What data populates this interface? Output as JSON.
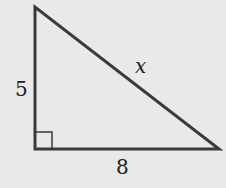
{
  "diagram": {
    "type": "right-triangle",
    "labels": {
      "left_leg": "5",
      "bottom_leg": "8",
      "hypotenuse": "x"
    },
    "colors": {
      "background": "#e9e9e9",
      "stroke": "#3a3a3a"
    }
  }
}
